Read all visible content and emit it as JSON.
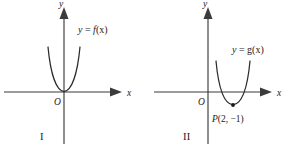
{
  "figure": {
    "panels": [
      {
        "id": "I",
        "number_label": "I",
        "axis_x_label": "x",
        "axis_y_label": "y",
        "origin_label": "O",
        "function_label": "y = f(x)",
        "function_label_y": "y",
        "function_label_eq": " = ",
        "function_label_fn": "f",
        "function_label_arg": "(x)",
        "curve": {
          "type": "parabola",
          "vertex_x": 0,
          "vertex_y": 0,
          "opens": "up",
          "touches_x_axis_at_origin": true
        },
        "point_label": ""
      },
      {
        "id": "II",
        "number_label": "II",
        "axis_x_label": "x",
        "axis_y_label": "y",
        "origin_label": "O",
        "function_label": "y = g(x)",
        "function_label_y": "y",
        "function_label_eq": " = ",
        "function_label_fn": "g",
        "function_label_arg": "(x)",
        "curve": {
          "type": "parabola",
          "vertex_x": 2,
          "vertex_y": -1,
          "opens": "up",
          "touches_x_axis_at_origin": false
        },
        "point_label": "P(2, −1)",
        "point_label_p": "P",
        "point_label_coords": "(2, −1)",
        "point_x": 2,
        "point_y": -1
      }
    ],
    "colors": {
      "axis": "#3b3b3b",
      "curve": "#2b2b2b",
      "text": "#1a1a1a",
      "background": "#ffffff"
    }
  }
}
